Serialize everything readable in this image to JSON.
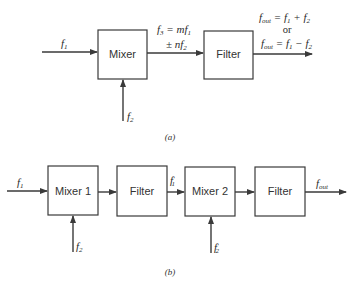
{
  "diagram_a": {
    "caption": "(a)",
    "input_f1": {
      "base": "f",
      "sub": "1"
    },
    "input_f2": {
      "base": "f",
      "sub": "2"
    },
    "mixer_label": "Mixer",
    "filter_label": "Filter",
    "f3_line1": {
      "lhs": "f",
      "lhs_sub": "3",
      "eq": " = ",
      "coef": "mf",
      "coef_sub": "1"
    },
    "f3_line2": {
      "pm": "± ",
      "coef": "nf",
      "coef_sub": "2"
    },
    "fout_line1": {
      "base": "f",
      "sub": "out",
      "rest": " = f",
      "s1": "1",
      "op": " + f",
      "s2": "2"
    },
    "fout_or": "or",
    "fout_line2": {
      "base": "f",
      "sub": "out",
      "rest": " = f",
      "s1": "1",
      "op": " − f",
      "s2": "2"
    }
  },
  "diagram_b": {
    "caption": "(b)",
    "input_f1": {
      "base": "f",
      "sub": "1"
    },
    "input_f2": {
      "base": "f",
      "sub": "2"
    },
    "mixer1_label": "Mixer 1",
    "filter1_label": "Filter",
    "intermediate": {
      "base": "f",
      "prime": "′",
      "sub": "1"
    },
    "mixer2_label": "Mixer 2",
    "input_f2_prime": {
      "base": "f",
      "prime": "′",
      "sub": "2"
    },
    "filter2_label": "Filter",
    "output": {
      "base": "f",
      "sub": "out"
    }
  },
  "colors": {
    "line": "#3a3a3a",
    "text": "#2a2a2a",
    "background": "#ffffff"
  }
}
